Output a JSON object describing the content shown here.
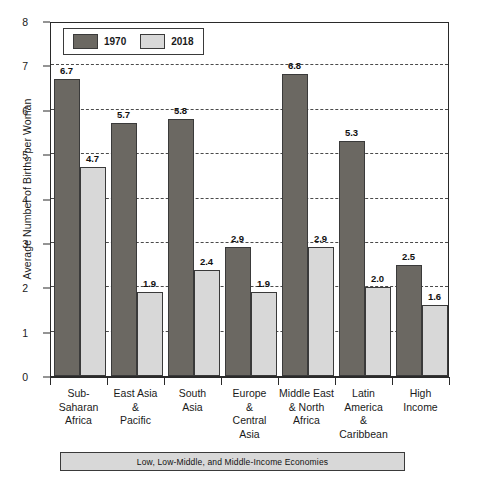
{
  "chart_data": {
    "type": "bar",
    "title": "",
    "xlabel": "",
    "ylabel": "Average Number of Births per Woman",
    "ylim": [
      0,
      8
    ],
    "ytick_step": 1,
    "grid": true,
    "grid_style": "dashed-horizontal",
    "legend_position": "top-left-inside",
    "categories": [
      "Sub-Saharan Africa",
      "East Asia & Pacific",
      "South Asia",
      "Europe & Central Asia",
      "Middle East & North Africa",
      "Latin America & Caribbean",
      "High Income"
    ],
    "category_lines": [
      [
        "Sub-",
        "Saharan",
        "Africa"
      ],
      [
        "East Asia",
        "&",
        "Pacific"
      ],
      [
        "South",
        "Asia"
      ],
      [
        "Europe",
        "&",
        "Central",
        "Asia"
      ],
      [
        "Middle East",
        "& North",
        "Africa"
      ],
      [
        "Latin",
        "America",
        "&",
        "Caribbean"
      ],
      [
        "High",
        "Income"
      ]
    ],
    "series": [
      {
        "name": "1970",
        "color": "#6b6862",
        "values": [
          6.7,
          5.7,
          5.8,
          2.9,
          6.8,
          5.3,
          2.5
        ]
      },
      {
        "name": "2018",
        "color": "#d8d8d8",
        "values": [
          4.7,
          1.9,
          2.4,
          1.9,
          2.9,
          2.0,
          1.6
        ]
      }
    ],
    "ytick_labels": [
      "0",
      "1",
      "2",
      "3",
      "4",
      "5",
      "6",
      "7",
      "8"
    ],
    "annotation": "Low, Low-Middle, and Middle-Income Economies"
  },
  "legend": {
    "items": [
      {
        "label": "1970"
      },
      {
        "label": "2018"
      }
    ]
  },
  "caption": {
    "text": "Low, Low-Middle, and Middle-Income Economies"
  },
  "colors": {
    "series_1970": "#6b6862",
    "series_2018": "#d8d8d8",
    "axis": "#2a2a2a",
    "grid": "#4a4a4a",
    "background": "#ffffff"
  }
}
